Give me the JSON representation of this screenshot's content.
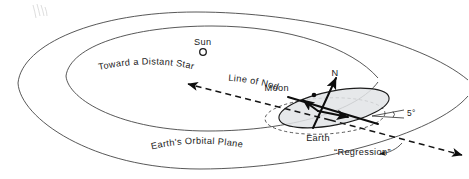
{
  "diagram": {
    "background_color": "#ffffff",
    "ink_color": "#1a1a1a",
    "shade_color": "#e2e4e6",
    "labels": {
      "sun": "Sun",
      "toward_distant_star": "Toward a Distant Star",
      "line_of_nodes": "Line of Nodes",
      "moon": "Moon",
      "north_pole": "N",
      "earth": "Earth",
      "inclination_angle": "5°",
      "regression": "“Regression”",
      "earths_orbital_plane": "Earth's Orbital Plane"
    },
    "elements": {
      "sun_marker": "sun-circle-icon",
      "moon_marker": "moon-dot-icon",
      "north_axis_arrow": "north-axis-arrow-icon",
      "nodes_arrow_left": "arrowhead-left-icon",
      "nodes_arrow_right": "arrowhead-right-icon",
      "regression_arrow": "curved-arrow-icon",
      "angle_marker": "angle-arc-icon",
      "outer_plane_ellipse": "outer-ellipse-shape",
      "inner_plane_ellipse": "inner-ellipse-shape",
      "moon_orbit_ellipse": "moon-orbit-ellipse-shape",
      "ecliptic_ref_ellipse": "ecliptic-reference-dashed-ellipse"
    }
  }
}
